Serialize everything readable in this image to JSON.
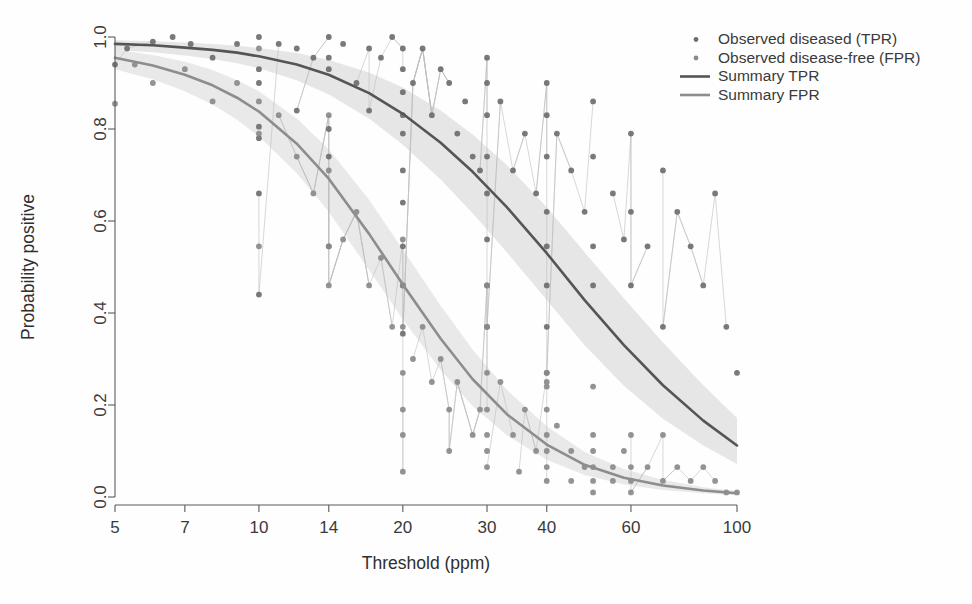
{
  "chart_data": {
    "type": "line",
    "title": "",
    "subtitle": "",
    "xlabel": "Threshold (ppm)",
    "ylabel": "Probability positive",
    "xscale": "log",
    "xlim": [
      5,
      100
    ],
    "ylim": [
      0.0,
      1.0
    ],
    "grid": false,
    "legend_position": "top-right",
    "xticks": [
      5,
      7,
      10,
      14,
      20,
      30,
      40,
      60,
      100
    ],
    "xtick_labels": [
      "5",
      "7",
      "10",
      "14",
      "20",
      "30",
      "40",
      "60",
      "100"
    ],
    "yticks": [
      0.0,
      0.2,
      0.4,
      0.6,
      0.8,
      1.0
    ],
    "ytick_labels": [
      "0.0",
      "0.2",
      "0.4",
      "0.6",
      "0.8",
      "1.0"
    ],
    "legend": [
      {
        "label": "Observed diseased (TPR)",
        "marker": "dot",
        "color": "#6e6e6e"
      },
      {
        "label": "Observed disease-free (FPR)",
        "marker": "dot",
        "color": "#8a8a8a"
      },
      {
        "label": "Summary TPR",
        "marker": "line",
        "color": "#555555"
      },
      {
        "label": "Summary FPR",
        "marker": "line",
        "color": "#8d8d8d"
      }
    ],
    "series": [
      {
        "name": "Summary TPR",
        "type": "line",
        "color": "#555555",
        "x": [
          5,
          6,
          7,
          8,
          9,
          10,
          12,
          14,
          17,
          20,
          24,
          28,
          33,
          40,
          48,
          58,
          70,
          85,
          100
        ],
        "values": [
          0.985,
          0.982,
          0.977,
          0.972,
          0.966,
          0.958,
          0.94,
          0.918,
          0.878,
          0.833,
          0.77,
          0.707,
          0.63,
          0.53,
          0.428,
          0.33,
          0.243,
          0.166,
          0.112
        ],
        "band": {
          "name": "95% confidence band",
          "color": "#d6d6d6",
          "lower": [
            0.972,
            0.967,
            0.96,
            0.952,
            0.943,
            0.932,
            0.906,
            0.875,
            0.823,
            0.766,
            0.69,
            0.617,
            0.532,
            0.428,
            0.33,
            0.242,
            0.17,
            0.112,
            0.072
          ],
          "upper": [
            0.993,
            0.991,
            0.988,
            0.985,
            0.981,
            0.976,
            0.965,
            0.95,
            0.923,
            0.89,
            0.84,
            0.788,
            0.722,
            0.63,
            0.532,
            0.432,
            0.336,
            0.243,
            0.172
          ]
        }
      },
      {
        "name": "Summary FPR",
        "type": "line",
        "color": "#8d8d8d",
        "x": [
          5,
          6,
          7,
          8,
          9,
          10,
          12,
          14,
          17,
          20,
          24,
          28,
          33,
          40,
          48,
          58,
          70,
          85,
          100
        ],
        "values": [
          0.955,
          0.938,
          0.918,
          0.895,
          0.868,
          0.838,
          0.768,
          0.692,
          0.572,
          0.462,
          0.344,
          0.256,
          0.18,
          0.114,
          0.07,
          0.042,
          0.025,
          0.014,
          0.008
        ],
        "band": {
          "name": "95% confidence band",
          "color": "#dcdcdc",
          "lower": [
            0.93,
            0.908,
            0.882,
            0.853,
            0.82,
            0.784,
            0.704,
            0.62,
            0.494,
            0.386,
            0.276,
            0.198,
            0.134,
            0.081,
            0.048,
            0.027,
            0.015,
            0.008,
            0.004
          ],
          "upper": [
            0.973,
            0.961,
            0.946,
            0.928,
            0.906,
            0.882,
            0.823,
            0.756,
            0.646,
            0.538,
            0.416,
            0.32,
            0.233,
            0.154,
            0.098,
            0.061,
            0.037,
            0.021,
            0.013
          ]
        }
      },
      {
        "name": "Observed diseased (TPR)",
        "type": "scatter",
        "color": "#6e6e6e",
        "points": [
          [
            5,
            0.94
          ],
          [
            5.3,
            0.975
          ],
          [
            6,
            0.99
          ],
          [
            6.6,
            1.0
          ],
          [
            7.2,
            0.985
          ],
          [
            8,
            0.955
          ],
          [
            9,
            0.985
          ],
          [
            10,
            1.0
          ],
          [
            10,
            0.93
          ],
          [
            10,
            0.9
          ],
          [
            10,
            0.805
          ],
          [
            10,
            0.78
          ],
          [
            10,
            0.66
          ],
          [
            10,
            0.44
          ],
          [
            11,
            0.985
          ],
          [
            12,
            0.975
          ],
          [
            12,
            0.84
          ],
          [
            13,
            0.955
          ],
          [
            14,
            1.0
          ],
          [
            14,
            0.955
          ],
          [
            14,
            0.93
          ],
          [
            14,
            0.8
          ],
          [
            14,
            0.74
          ],
          [
            14,
            0.545
          ],
          [
            15,
            0.985
          ],
          [
            16,
            0.9
          ],
          [
            17,
            0.975
          ],
          [
            17,
            0.84
          ],
          [
            18,
            0.955
          ],
          [
            19,
            1.0
          ],
          [
            20,
            0.975
          ],
          [
            20,
            0.93
          ],
          [
            20,
            0.88
          ],
          [
            20,
            0.83
          ],
          [
            20,
            0.79
          ],
          [
            20,
            0.71
          ],
          [
            20,
            0.64
          ],
          [
            20,
            0.545
          ],
          [
            20,
            0.46
          ],
          [
            20,
            0.355
          ],
          [
            21,
            0.9
          ],
          [
            22,
            0.975
          ],
          [
            23,
            0.83
          ],
          [
            24,
            0.93
          ],
          [
            25,
            0.9
          ],
          [
            26,
            0.79
          ],
          [
            27,
            0.86
          ],
          [
            28,
            0.74
          ],
          [
            29,
            0.71
          ],
          [
            30,
            0.955
          ],
          [
            30,
            0.9
          ],
          [
            30,
            0.83
          ],
          [
            30,
            0.74
          ],
          [
            30,
            0.66
          ],
          [
            30,
            0.56
          ],
          [
            30,
            0.46
          ],
          [
            30,
            0.37
          ],
          [
            32,
            0.86
          ],
          [
            34,
            0.71
          ],
          [
            36,
            0.79
          ],
          [
            38,
            0.66
          ],
          [
            40,
            0.9
          ],
          [
            40,
            0.83
          ],
          [
            40,
            0.74
          ],
          [
            40,
            0.62
          ],
          [
            40,
            0.545
          ],
          [
            40,
            0.46
          ],
          [
            40,
            0.37
          ],
          [
            40,
            0.27
          ],
          [
            42,
            0.79
          ],
          [
            45,
            0.71
          ],
          [
            48,
            0.62
          ],
          [
            50,
            0.86
          ],
          [
            50,
            0.74
          ],
          [
            50,
            0.545
          ],
          [
            50,
            0.46
          ],
          [
            55,
            0.66
          ],
          [
            58,
            0.56
          ],
          [
            60,
            0.79
          ],
          [
            60,
            0.62
          ],
          [
            60,
            0.46
          ],
          [
            65,
            0.545
          ],
          [
            70,
            0.71
          ],
          [
            70,
            0.37
          ],
          [
            75,
            0.62
          ],
          [
            80,
            0.545
          ],
          [
            85,
            0.46
          ],
          [
            90,
            0.66
          ],
          [
            95,
            0.37
          ],
          [
            100,
            0.27
          ]
        ]
      },
      {
        "name": "Observed disease-free (FPR)",
        "type": "scatter",
        "color": "#8a8a8a",
        "points": [
          [
            5,
            0.855
          ],
          [
            5.5,
            0.94
          ],
          [
            6,
            0.9
          ],
          [
            7,
            0.93
          ],
          [
            8,
            0.86
          ],
          [
            9,
            0.9
          ],
          [
            10,
            0.975
          ],
          [
            10,
            0.86
          ],
          [
            10,
            0.79
          ],
          [
            10,
            0.545
          ],
          [
            11,
            0.83
          ],
          [
            12,
            0.74
          ],
          [
            13,
            0.66
          ],
          [
            14,
            0.83
          ],
          [
            14,
            0.71
          ],
          [
            14,
            0.545
          ],
          [
            14,
            0.46
          ],
          [
            15,
            0.56
          ],
          [
            16,
            0.62
          ],
          [
            17,
            0.46
          ],
          [
            18,
            0.52
          ],
          [
            19,
            0.37
          ],
          [
            20,
            0.56
          ],
          [
            20,
            0.46
          ],
          [
            20,
            0.37
          ],
          [
            20,
            0.27
          ],
          [
            20,
            0.19
          ],
          [
            20,
            0.135
          ],
          [
            21,
            0.3
          ],
          [
            22,
            0.37
          ],
          [
            23,
            0.25
          ],
          [
            24,
            0.3
          ],
          [
            25,
            0.19
          ],
          [
            26,
            0.25
          ],
          [
            28,
            0.135
          ],
          [
            29,
            0.19
          ],
          [
            30,
            0.46
          ],
          [
            30,
            0.37
          ],
          [
            30,
            0.27
          ],
          [
            30,
            0.19
          ],
          [
            30,
            0.135
          ],
          [
            30,
            0.1
          ],
          [
            30,
            0.065
          ],
          [
            32,
            0.25
          ],
          [
            34,
            0.135
          ],
          [
            36,
            0.19
          ],
          [
            38,
            0.1
          ],
          [
            40,
            0.27
          ],
          [
            40,
            0.25
          ],
          [
            40,
            0.24
          ],
          [
            40,
            0.19
          ],
          [
            40,
            0.135
          ],
          [
            40,
            0.1
          ],
          [
            40,
            0.065
          ],
          [
            40,
            0.035
          ],
          [
            42,
            0.155
          ],
          [
            45,
            0.1
          ],
          [
            48,
            0.065
          ],
          [
            50,
            0.24
          ],
          [
            50,
            0.135
          ],
          [
            50,
            0.1
          ],
          [
            50,
            0.065
          ],
          [
            50,
            0.035
          ],
          [
            50,
            0.01
          ],
          [
            55,
            0.065
          ],
          [
            55,
            0.035
          ],
          [
            58,
            0.1
          ],
          [
            60,
            0.135
          ],
          [
            60,
            0.065
          ],
          [
            60,
            0.035
          ],
          [
            60,
            0.01
          ],
          [
            65,
            0.065
          ],
          [
            70,
            0.135
          ],
          [
            70,
            0.035
          ],
          [
            75,
            0.065
          ],
          [
            80,
            0.035
          ],
          [
            85,
            0.065
          ],
          [
            90,
            0.035
          ],
          [
            95,
            0.01
          ],
          [
            100,
            0.01
          ],
          [
            20,
            0.055
          ],
          [
            25,
            0.1
          ],
          [
            35,
            0.055
          ],
          [
            45,
            0.035
          ]
        ]
      }
    ],
    "study_lines_note": "thin light lines connect observations within each study"
  }
}
